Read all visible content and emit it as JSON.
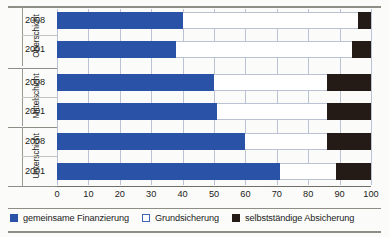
{
  "chart_data": {
    "type": "bar",
    "orientation": "horizontal",
    "stacked": true,
    "stacked_total": 100,
    "title": "",
    "xlabel": "",
    "ylabel": "",
    "xlim": [
      0,
      100
    ],
    "xticks": [
      0,
      10,
      20,
      30,
      40,
      50,
      60,
      70,
      80,
      90,
      100
    ],
    "grid": true,
    "grid_axis": "x",
    "legend_position": "bottom",
    "groups": [
      "Oberschicht",
      "Mittelschicht",
      "Unterschicht"
    ],
    "categories": [
      "Oberschicht 2008",
      "Oberschicht 2001",
      "Mittelschicht 2008",
      "Mittelschicht 2001",
      "Unterschicht 2008",
      "Unterschicht 2001"
    ],
    "series": [
      {
        "name": "gemeinsame Finanzierung",
        "color": "#2a53a8",
        "values": [
          40,
          38,
          50,
          51,
          60,
          71
        ]
      },
      {
        "name": "Grundsicherung",
        "color": "#ffffff",
        "values": [
          56,
          56,
          36,
          35,
          26,
          18
        ]
      },
      {
        "name": "selbstständige Absicherung",
        "color": "#241b16",
        "values": [
          4,
          6,
          14,
          14,
          14,
          11
        ]
      }
    ]
  },
  "groups": [
    {
      "label": "Oberschicht",
      "rows": [
        {
          "label": "2008",
          "values": [
            40,
            56,
            4
          ]
        },
        {
          "label": "2001",
          "values": [
            38,
            56,
            6
          ]
        }
      ]
    },
    {
      "label": "Mittelschicht",
      "rows": [
        {
          "label": "2008",
          "values": [
            50,
            36,
            14
          ]
        },
        {
          "label": "2001",
          "values": [
            51,
            35,
            14
          ]
        }
      ]
    },
    {
      "label": "Unterschicht",
      "rows": [
        {
          "label": "2008",
          "values": [
            60,
            26,
            14
          ]
        },
        {
          "label": "2001",
          "values": [
            71,
            18,
            11
          ]
        }
      ]
    }
  ],
  "axis": {
    "ticks": [
      "0",
      "10",
      "20",
      "30",
      "40",
      "50",
      "60",
      "70",
      "80",
      "90",
      "100"
    ]
  },
  "legend": {
    "items": [
      {
        "label": "gemeinsame Finanzierung",
        "swatch": "filled-blue",
        "color": "#2a53a8"
      },
      {
        "label": "Grundsicherung",
        "swatch": "outline-white",
        "color": "#ffffff"
      },
      {
        "label": "selbstständige Absicherung",
        "swatch": "filled-black",
        "color": "#241b16"
      }
    ]
  }
}
